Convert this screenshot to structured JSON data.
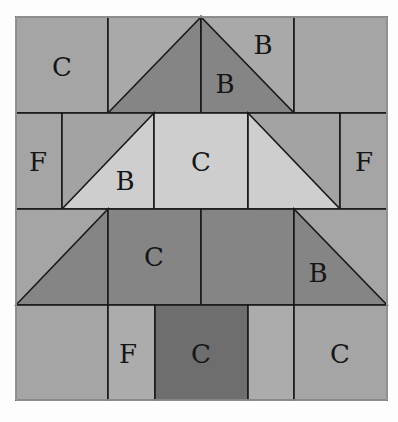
{
  "colors": {
    "background": "#fdfdfd",
    "medium": "#a3a3a3",
    "medium_light": "#acacac",
    "dark": "#858585",
    "darker": "#6e6e6e",
    "light": "#cecece",
    "line": "#1a1a1a"
  },
  "labels": {
    "r1_left": "C",
    "r1_tri_dark": "B",
    "r1_tri_light": "B",
    "r2_left": "F",
    "r2_tri": "B",
    "r2_center": "C",
    "r2_right": "F",
    "r3_center": "C",
    "r3_tri": "B",
    "r4_f": "F",
    "r4_trunk": "C",
    "r4_right": "C"
  }
}
